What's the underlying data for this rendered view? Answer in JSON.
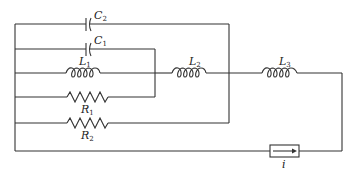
{
  "diagram": {
    "type": "circuit",
    "components": [
      {
        "id": "C2",
        "kind": "capacitor",
        "label": "C",
        "subscript": "2"
      },
      {
        "id": "C1",
        "kind": "capacitor",
        "label": "C",
        "subscript": "1"
      },
      {
        "id": "L1",
        "kind": "inductor",
        "label": "L",
        "subscript": "1"
      },
      {
        "id": "L2",
        "kind": "inductor",
        "label": "L",
        "subscript": "2"
      },
      {
        "id": "L3",
        "kind": "inductor",
        "label": "L",
        "subscript": "3"
      },
      {
        "id": "R1",
        "kind": "resistor",
        "label": "R",
        "subscript": "1"
      },
      {
        "id": "R2",
        "kind": "resistor",
        "label": "R",
        "subscript": "2"
      },
      {
        "id": "i",
        "kind": "current-source",
        "label": "i",
        "subscript": ""
      }
    ]
  }
}
